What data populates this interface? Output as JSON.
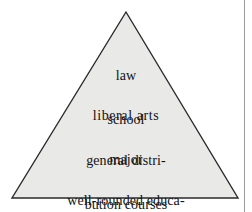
{
  "figure": {
    "name": "education-pyramid",
    "shape": "triangle",
    "fill_color": "#e9e9e7",
    "stroke_color": "#2b2b2b",
    "background_color": "#ffffff",
    "gutter_rule_color": "#9a9a9a",
    "text_color": "#121212",
    "apex": {
      "x": 126,
      "y": 12
    },
    "bottom_left": {
      "x": 12,
      "y": 198
    },
    "bottom_right": {
      "x": 238,
      "y": 198
    }
  },
  "tiers": [
    {
      "id": "tier-1",
      "name": "law-school",
      "lines": [
        "law",
        "school"
      ]
    },
    {
      "id": "tier-2",
      "name": "liberal-arts-major",
      "lines": [
        "liberal arts",
        "major"
      ]
    },
    {
      "id": "tier-3",
      "name": "general-distribution-courses",
      "lines": [
        "general distri-",
        "bution courses"
      ]
    },
    {
      "id": "tier-4",
      "name": "well-rounded-education-before-college",
      "lines": [
        "well-rounded educa-",
        "tion before college"
      ]
    }
  ]
}
